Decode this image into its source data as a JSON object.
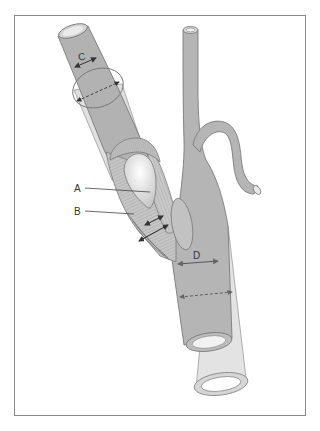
{
  "figure": {
    "type": "anatomical-diagram",
    "labels": {
      "A": "A",
      "B": "B",
      "C": "C",
      "D": "D"
    }
  },
  "colors": {
    "vessel_fill": "#b3b3b3",
    "vessel_stroke": "#7a7a7a",
    "sleeve_fill": "#dcdcdc",
    "tissue_fill": "#c8c8c8",
    "lumen_fill": "#eeeeee",
    "arrow": "#333333",
    "frame": "#8a8a8a"
  }
}
